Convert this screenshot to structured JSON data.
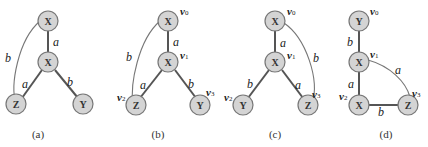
{
  "node_color": "#d4d4d4",
  "graphs": [
    {
      "caption": "(a)",
      "nodes": [
        {
          "id": "n0",
          "label": "X",
          "vertex": ""
        },
        {
          "id": "n1",
          "label": "X",
          "vertex": ""
        },
        {
          "id": "n2",
          "label": "Z",
          "vertex": ""
        },
        {
          "id": "n3",
          "label": "Y",
          "vertex": ""
        }
      ],
      "edges": [
        {
          "from": "n0",
          "to": "n1",
          "label": "a"
        },
        {
          "from": "n0",
          "to": "n2",
          "label": "b"
        },
        {
          "from": "n1",
          "to": "n2",
          "label": "a"
        },
        {
          "from": "n1",
          "to": "n3",
          "label": "b"
        }
      ]
    },
    {
      "caption": "(b)",
      "nodes": [
        {
          "id": "n0",
          "label": "X",
          "vertex": "v0"
        },
        {
          "id": "n1",
          "label": "X",
          "vertex": "v1"
        },
        {
          "id": "n2",
          "label": "Z",
          "vertex": "v2"
        },
        {
          "id": "n3",
          "label": "Y",
          "vertex": "v3"
        }
      ],
      "edges": [
        {
          "from": "n0",
          "to": "n1",
          "label": "a"
        },
        {
          "from": "n0",
          "to": "n2",
          "label": "b"
        },
        {
          "from": "n1",
          "to": "n2",
          "label": "a"
        },
        {
          "from": "n1",
          "to": "n3",
          "label": "b"
        }
      ]
    },
    {
      "caption": "(c)",
      "nodes": [
        {
          "id": "n0",
          "label": "X",
          "vertex": "v0"
        },
        {
          "id": "n1",
          "label": "X",
          "vertex": "v1"
        },
        {
          "id": "n2",
          "label": "Y",
          "vertex": "v2"
        },
        {
          "id": "n3",
          "label": "Z",
          "vertex": "v3"
        }
      ],
      "edges": [
        {
          "from": "n0",
          "to": "n1",
          "label": "a"
        },
        {
          "from": "n0",
          "to": "n3",
          "label": "b"
        },
        {
          "from": "n1",
          "to": "n2",
          "label": "b"
        },
        {
          "from": "n1",
          "to": "n3",
          "label": "a"
        }
      ]
    },
    {
      "caption": "(d)",
      "nodes": [
        {
          "id": "n0",
          "label": "Y",
          "vertex": "v0"
        },
        {
          "id": "n1",
          "label": "X",
          "vertex": "v1"
        },
        {
          "id": "n2",
          "label": "X",
          "vertex": "v2"
        },
        {
          "id": "n3",
          "label": "Z",
          "vertex": "v3"
        }
      ],
      "edges": [
        {
          "from": "n0",
          "to": "n1",
          "label": "b"
        },
        {
          "from": "n1",
          "to": "n2",
          "label": "a"
        },
        {
          "from": "n1",
          "to": "n3",
          "label": "a"
        },
        {
          "from": "n2",
          "to": "n3",
          "label": "b"
        }
      ]
    }
  ]
}
